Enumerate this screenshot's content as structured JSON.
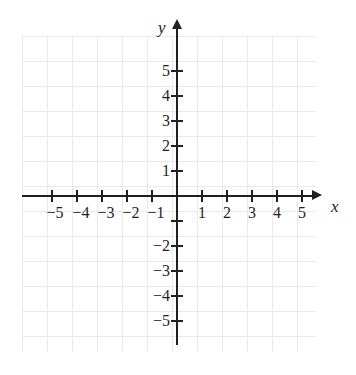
{
  "figure": {
    "background_color": "#ffffff",
    "axis_color": "#221f1f",
    "grid_color": "#e9e9e9"
  },
  "axis_labels": {
    "x": "x",
    "y": "y"
  },
  "chart_data": {
    "type": "scatter",
    "title": "",
    "xlabel": "x",
    "ylabel": "y",
    "xlim": [
      -5.8,
      5.6
    ],
    "ylim": [
      -5.9,
      6.2
    ],
    "grid": true,
    "grid_spacing": 1,
    "legend": null,
    "series": [],
    "x_ticks": [
      -5,
      -4,
      -3,
      -2,
      -1,
      1,
      2,
      3,
      4,
      5
    ],
    "y_ticks": [
      -5,
      -4,
      -3,
      -2,
      -1,
      1,
      2,
      3,
      4,
      5
    ],
    "x_tick_labels": [
      {
        "value": -5,
        "label": "−5"
      },
      {
        "value": -4,
        "label": "−4"
      },
      {
        "value": -3,
        "label": "−3"
      },
      {
        "value": -2,
        "label": "−2"
      },
      {
        "value": -1,
        "label": "−1"
      },
      {
        "value": 1,
        "label": "1"
      },
      {
        "value": 2,
        "label": "2"
      },
      {
        "value": 3,
        "label": "3"
      },
      {
        "value": 4,
        "label": "4"
      },
      {
        "value": 5,
        "label": "5"
      }
    ],
    "y_tick_labels": [
      {
        "value": 5,
        "label": "5"
      },
      {
        "value": 4,
        "label": "4"
      },
      {
        "value": 3,
        "label": "3"
      },
      {
        "value": 2,
        "label": "2"
      },
      {
        "value": 1,
        "label": "1"
      },
      {
        "value": -1,
        "label": ""
      },
      {
        "value": -2,
        "label": "−2"
      },
      {
        "value": -3,
        "label": "−3"
      },
      {
        "value": -4,
        "label": "−4"
      },
      {
        "value": -5,
        "label": "−5"
      }
    ],
    "annotations": []
  }
}
